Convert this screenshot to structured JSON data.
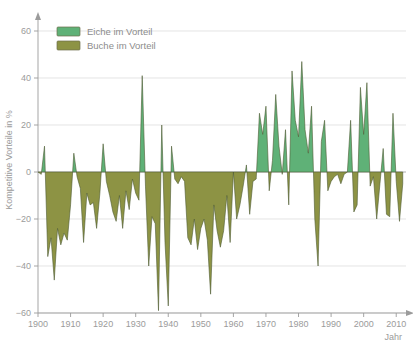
{
  "chart_data": {
    "type": "area",
    "title": "",
    "xlabel": "Jahr",
    "ylabel": "Kompetitive Vorteile in %",
    "xlim": [
      1900,
      2013
    ],
    "ylim": [
      -60,
      60
    ],
    "yticks": [
      0,
      20,
      40,
      60
    ],
    "ytick_labels": [
      "0",
      "20",
      "40",
      "60"
    ],
    "neg_yticks": [
      -20,
      -40,
      -60
    ],
    "neg_ytick_labels": [
      "20",
      "40",
      "60"
    ],
    "xticks": [
      1900,
      1910,
      1920,
      1930,
      1940,
      1950,
      1960,
      1970,
      1980,
      1990,
      2000,
      2010
    ],
    "xtick_labels": [
      "1900",
      "1910",
      "1920",
      "1930",
      "1940",
      "1950",
      "1960",
      "1970",
      "1980",
      "1990",
      "2000",
      "2010"
    ],
    "grid": true,
    "legend_position": "top-left",
    "colors": {
      "positive": "#5fb177",
      "negative": "#8d9344",
      "stroke": "#4d5a33",
      "grid": "#d9d9d9",
      "axis": "#9b9b9b",
      "text": "#9b9b9b",
      "background": "#ffffff"
    },
    "series": [
      {
        "name": "Kompetitive Vorteile",
        "positive_label": "Eiche im Vorteil",
        "negative_label": "Buche im Vorteil",
        "x": [
          1900,
          1901,
          1902,
          1903,
          1904,
          1905,
          1906,
          1907,
          1908,
          1909,
          1910,
          1911,
          1912,
          1913,
          1914,
          1915,
          1916,
          1917,
          1918,
          1919,
          1920,
          1921,
          1922,
          1923,
          1924,
          1925,
          1926,
          1927,
          1928,
          1929,
          1930,
          1931,
          1932,
          1933,
          1934,
          1935,
          1936,
          1937,
          1938,
          1939,
          1940,
          1941,
          1942,
          1943,
          1944,
          1945,
          1946,
          1947,
          1948,
          1949,
          1950,
          1951,
          1952,
          1953,
          1954,
          1955,
          1956,
          1957,
          1958,
          1959,
          1960,
          1961,
          1962,
          1963,
          1964,
          1965,
          1966,
          1967,
          1968,
          1969,
          1970,
          1971,
          1972,
          1973,
          1974,
          1975,
          1976,
          1977,
          1978,
          1979,
          1980,
          1981,
          1982,
          1983,
          1984,
          1985,
          1986,
          1987,
          1988,
          1989,
          1990,
          1991,
          1992,
          1993,
          1994,
          1995,
          1996,
          1997,
          1998,
          1999,
          2000,
          2001,
          2002,
          2003,
          2004,
          2005,
          2006,
          2007,
          2008,
          2009,
          2010,
          2011,
          2012
        ],
        "values": [
          0,
          -1,
          11,
          -36,
          -28,
          -46,
          -24,
          -31,
          -26,
          -29,
          -14,
          8,
          -2,
          -7,
          -30,
          -9,
          -14,
          -13,
          -24,
          -9,
          12,
          -4,
          -10,
          -17,
          -21,
          -10,
          -24,
          -8,
          -16,
          -3,
          -9,
          -12,
          41,
          -6,
          -40,
          -19,
          -22,
          -59,
          20,
          -30,
          -57,
          11,
          -3,
          -5,
          -2,
          -4,
          -28,
          -31,
          -20,
          -33,
          -24,
          -20,
          -29,
          -52,
          -14,
          -25,
          -32,
          -25,
          -10,
          -30,
          0,
          -20,
          -14,
          -6,
          3,
          -18,
          -4,
          -3,
          25,
          16,
          28,
          -8,
          5,
          33,
          11,
          -1,
          18,
          -14,
          43,
          22,
          15,
          47,
          18,
          8,
          28,
          -20,
          -40,
          13,
          22,
          -8,
          -4,
          -2,
          -1,
          -5,
          -1,
          0,
          22,
          -17,
          -14,
          36,
          16,
          38,
          -6,
          -2,
          -20,
          -5,
          10,
          -18,
          -19,
          25,
          -4,
          -21,
          -5
        ]
      }
    ]
  },
  "legend": {
    "items": [
      {
        "label": "Eiche im Vorteil",
        "color": "#5fb177"
      },
      {
        "label": "Buche im Vorteil",
        "color": "#8d9344"
      }
    ]
  },
  "axes": {
    "y_title": "Kompetitive Vorteile in %",
    "x_title": "Jahr"
  }
}
